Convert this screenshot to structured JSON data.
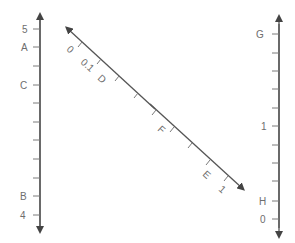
{
  "left_scale": {
    "labels": {
      "five": "5",
      "a": "A",
      "c": "C",
      "b": "B",
      "four": "4"
    }
  },
  "diagonal_scale": {
    "labels": {
      "zero": "0",
      "tenth": "0.1",
      "d": "D",
      "f": "F",
      "e": "E",
      "one": "1"
    }
  },
  "right_scale": {
    "labels": {
      "g": "G",
      "one": "1",
      "h": "H",
      "zero": "0"
    }
  },
  "colors": {
    "axis": "#555555",
    "tick": "#7a7a7a",
    "label": "#6e6e6e"
  }
}
